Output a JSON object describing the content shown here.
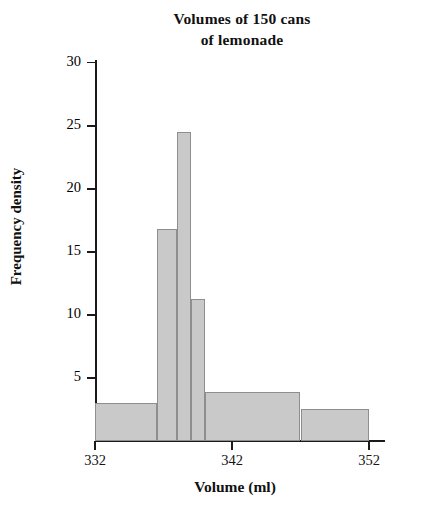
{
  "chart_data": {
    "type": "bar",
    "title": "Volumes of 150 cans of lemonade",
    "title_line1": "Volumes of 150 cans",
    "title_line2": "of lemonade",
    "xlabel": "Volume (ml)",
    "ylabel": "Frequency density",
    "xlim": [
      332,
      352
    ],
    "ylim": [
      0,
      30
    ],
    "x_ticks": [
      332,
      342,
      352
    ],
    "x_tick_labels": [
      "332",
      "342",
      "352"
    ],
    "y_ticks": [
      5,
      10,
      15,
      20,
      25,
      30
    ],
    "y_tick_labels": [
      "5",
      "10",
      "15",
      "20",
      "25",
      "30"
    ],
    "grid": false,
    "legend": "none",
    "bar_color": "#c9c9c9",
    "bar_edge_color": "#8e8e8e",
    "axis_color": "#1a1a1a",
    "bins": [
      {
        "label": "332-336.5",
        "x_start": 332,
        "x_end": 336.5,
        "frequency_density": 3.0
      },
      {
        "label": "336.5-338",
        "x_start": 336.5,
        "x_end": 338,
        "frequency_density": 16.8
      },
      {
        "label": "338-339",
        "x_start": 338,
        "x_end": 339,
        "frequency_density": 24.5
      },
      {
        "label": "339-340",
        "x_start": 339,
        "x_end": 340,
        "frequency_density": 11.3
      },
      {
        "label": "340-347",
        "x_start": 340,
        "x_end": 347,
        "frequency_density": 3.9
      },
      {
        "label": "347-352",
        "x_start": 347,
        "x_end": 352,
        "frequency_density": 2.5
      }
    ]
  },
  "axes": {
    "y_title": "Frequency density",
    "x_title": "Volume (ml)"
  }
}
